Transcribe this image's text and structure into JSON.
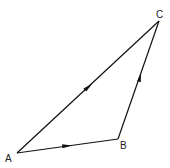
{
  "diagram": {
    "type": "vector-triangle",
    "points": {
      "A": {
        "label": "A",
        "x": 17,
        "y": 153
      },
      "B": {
        "label": "B",
        "x": 118,
        "y": 139
      },
      "C": {
        "label": "C",
        "x": 159,
        "y": 21
      }
    },
    "edges": [
      {
        "from": "A",
        "to": "B",
        "arrow": "toward B"
      },
      {
        "from": "B",
        "to": "C",
        "arrow": "toward C"
      },
      {
        "from": "A",
        "to": "C",
        "arrow": "toward C"
      }
    ],
    "stroke_color": "#111111"
  }
}
